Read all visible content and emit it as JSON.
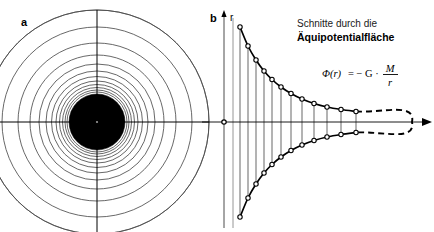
{
  "figure": {
    "background": "#ffffff",
    "ink": "#000000",
    "grid_color": "#4d4d4d",
    "width": 434,
    "height": 232
  },
  "panel_a": {
    "label": "a",
    "center": {
      "x": 97,
      "y": 122
    },
    "mass_disc_radius": 28,
    "axis_half_width": 112,
    "axis_half_height": 112,
    "equipotential_radii": [
      30,
      32,
      34.5,
      37.5,
      41,
      45.5,
      51,
      58,
      67,
      79,
      95,
      112,
      112
    ],
    "ring_count": 13
  },
  "panel_b": {
    "label": "b",
    "vertical_axis_name": "r",
    "origin": {
      "x": 224,
      "y": 122
    },
    "baseline_y": 122,
    "axis_right_x": 424,
    "axis_top_y": 16,
    "axis_bottom_y": 228,
    "second_vertical_line_x": 233,
    "curve_start_x": 240,
    "curve_top_y": 27,
    "curve_bottom_y": 217,
    "dashed_tip_x": 412,
    "marker_radius": 2.2,
    "tick_lines_x": [
      240,
      248,
      256,
      264,
      272,
      281,
      291,
      302,
      314,
      327,
      341,
      356
    ],
    "curve_marker_points_upper": [
      {
        "x": 240,
        "y": 27
      },
      {
        "x": 248,
        "y": 46
      },
      {
        "x": 256,
        "y": 60
      },
      {
        "x": 264,
        "y": 71
      },
      {
        "x": 272,
        "y": 79.5
      },
      {
        "x": 281,
        "y": 87
      },
      {
        "x": 291,
        "y": 93.5
      },
      {
        "x": 302,
        "y": 99
      },
      {
        "x": 314,
        "y": 103.5
      },
      {
        "x": 327,
        "y": 107
      },
      {
        "x": 341,
        "y": 109.5
      },
      {
        "x": 356,
        "y": 111.5
      }
    ],
    "caption": {
      "line1": "Schnitte durch die",
      "line2": "Äquipotentialfläche",
      "line1_pos": {
        "x": 297,
        "y": 27
      },
      "line2_pos": {
        "x": 297,
        "y": 41
      }
    },
    "formula": {
      "lhs": "Φ(r)",
      "equals": "= − G ·",
      "numerator": "M",
      "denominator": "r",
      "pos": {
        "x": 322,
        "y": 77
      }
    }
  }
}
